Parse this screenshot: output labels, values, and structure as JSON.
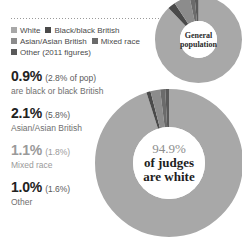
{
  "legend": {
    "rows": [
      [
        {
          "label": "White",
          "color": "#a8a8a8"
        },
        {
          "label": "Black/black British",
          "color": "#4a4a4a"
        }
      ],
      [
        {
          "label": "Asian/Asian British",
          "color": "#8c8c8c"
        },
        {
          "label": "Mixed race",
          "color": "#6b6b6b"
        }
      ],
      [
        {
          "label": "Other (2011 figures)",
          "color": "#5a5a5a"
        }
      ]
    ]
  },
  "stats": [
    {
      "value": "0.9%",
      "paren": "(2.8% of pop)",
      "desc": "are black or\nblack British"
    },
    {
      "value": "2.1%",
      "paren": "(5.8%)",
      "desc": "Asian/Asian\nBritish"
    },
    {
      "value": "1.1%",
      "paren": "(1.8%)",
      "desc": "Mixed race"
    },
    {
      "value": "1.0%",
      "paren": "(1.6%)",
      "desc": "Other"
    }
  ],
  "donut_small": {
    "label_line1": "General",
    "label_line2": "population"
  },
  "donut_large": {
    "pct": "94.9%",
    "line1": "of judges",
    "line2": "are white"
  },
  "chart_data": [
    {
      "type": "pie",
      "title": "General population",
      "categories": [
        "White",
        "Black/black British",
        "Asian/Asian British",
        "Mixed race",
        "Other"
      ],
      "values": [
        86.0,
        2.8,
        5.8,
        1.8,
        1.6
      ],
      "colors": [
        "#a8a8a8",
        "#4a4a4a",
        "#8c8c8c",
        "#6b6b6b",
        "#5a5a5a"
      ],
      "legend": "top-left",
      "note": "2011 figures"
    },
    {
      "type": "pie",
      "title": "94.9% of judges are white",
      "categories": [
        "White",
        "Black/black British",
        "Asian/Asian British",
        "Mixed race",
        "Other"
      ],
      "values": [
        94.9,
        0.9,
        2.1,
        1.1,
        1.0
      ],
      "colors": [
        "#a8a8a8",
        "#4a4a4a",
        "#8c8c8c",
        "#6b6b6b",
        "#5a5a5a"
      ],
      "legend": "top-left"
    }
  ]
}
